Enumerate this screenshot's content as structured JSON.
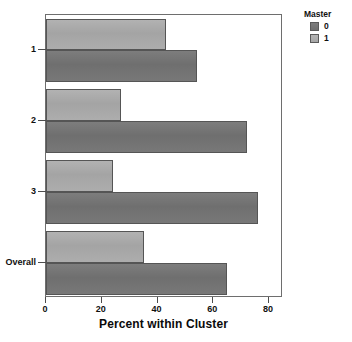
{
  "chart_data": {
    "type": "bar",
    "orientation": "horizontal",
    "title": "",
    "xlabel": "Percent within Cluster",
    "ylabel": "",
    "xlim": [
      0,
      85
    ],
    "xticks": [
      0,
      20,
      40,
      60,
      80
    ],
    "xtick_labels": [
      "0",
      "20",
      "40",
      "60",
      "80"
    ],
    "categories": [
      "1",
      "2",
      "3",
      "Overall"
    ],
    "grid": false,
    "legend": {
      "title": "Master",
      "position": "right",
      "entries": [
        {
          "label": "0",
          "color": "#737373"
        },
        {
          "label": "1",
          "color": "#a8a8a8"
        }
      ]
    },
    "series": [
      {
        "name": "0",
        "color": "#737373",
        "values": [
          54,
          72,
          76,
          65
        ]
      },
      {
        "name": "1",
        "color": "#a8a8a8",
        "values": [
          43,
          27,
          24,
          35
        ]
      }
    ]
  },
  "legend": {
    "title": "Master",
    "items": [
      {
        "label": "0"
      },
      {
        "label": "1"
      }
    ]
  },
  "axis": {
    "x_title": "Percent within Cluster",
    "x_tick_labels": [
      "0",
      "20",
      "40",
      "60",
      "80"
    ],
    "y_tick_labels": [
      "1",
      "2",
      "3",
      "Overall"
    ]
  }
}
